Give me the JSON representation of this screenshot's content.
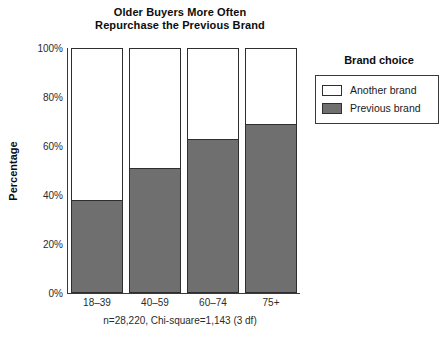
{
  "chart_data": {
    "type": "bar",
    "subtype": "stacked-percentage",
    "title_line1": "Older Buyers More Often",
    "title_line2": "Repurchase the Previous Brand",
    "xlabel": "",
    "ylabel": "Percentage",
    "ylim": [
      0,
      100
    ],
    "ytick_labels": [
      "0%",
      "20%",
      "40%",
      "60%",
      "80%",
      "100%"
    ],
    "ytick_values": [
      0,
      20,
      40,
      60,
      80,
      100
    ],
    "grid": false,
    "legend_position": "right",
    "legend_title": "Brand choice",
    "categories": [
      "18–39",
      "40–59",
      "60–74",
      "75+"
    ],
    "series": [
      {
        "name": "Another brand",
        "color": "#ffffff",
        "values": [
          62,
          49,
          37,
          31
        ]
      },
      {
        "name": "Previous brand",
        "color": "#6f6f6f",
        "values": [
          38,
          51,
          63,
          69
        ]
      }
    ],
    "annotation": "n=28,220, Chi-square=1,143 (3 df)"
  },
  "legend": {
    "title": "Brand choice",
    "items": [
      {
        "label": "Another brand",
        "swatch": "white"
      },
      {
        "label": "Previous brand",
        "swatch": "gray"
      }
    ]
  },
  "colors": {
    "previous_brand": "#6f6f6f",
    "another_brand": "#ffffff",
    "outline": "#2e2e2e",
    "axis": "#3a3a3a",
    "text": "#1a1a1a"
  }
}
